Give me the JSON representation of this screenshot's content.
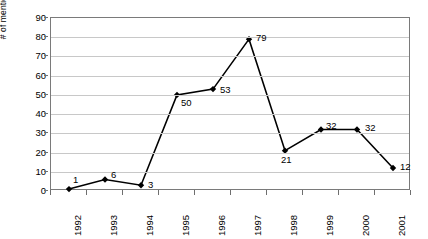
{
  "chart_data": {
    "type": "line",
    "title": "",
    "xlabel": "",
    "ylabel": "# of mentions",
    "categories": [
      "1992",
      "1993",
      "1994",
      "1995",
      "1996",
      "1997",
      "1998",
      "1999",
      "2000",
      "2001"
    ],
    "values": [
      1,
      6,
      3,
      50,
      53,
      79,
      21,
      32,
      32,
      12
    ],
    "series": [
      {
        "name": "# of mentions",
        "values": [
          1,
          6,
          3,
          50,
          53,
          79,
          21,
          32,
          32,
          12
        ]
      }
    ],
    "data_labels": [
      "1",
      "6",
      "3",
      "50",
      "53",
      "79",
      "21",
      "32",
      "32",
      "12"
    ],
    "ylim": [
      0,
      90
    ],
    "y_ticks": [
      "0",
      "10",
      "20",
      "30",
      "40",
      "50",
      "60",
      "70",
      "80",
      "90"
    ],
    "grid": true,
    "legend": "none",
    "marker": "diamond",
    "line_color": "#000000",
    "marker_color": "#000000",
    "grid_color": "#c8c8c8",
    "frame_color": "#7a7a7a",
    "background_color": "#ffffff"
  }
}
